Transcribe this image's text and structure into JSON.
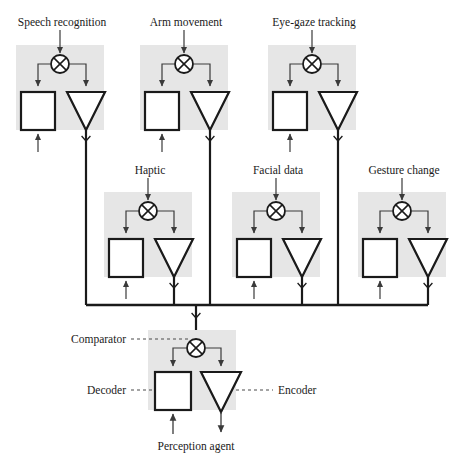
{
  "diagram": {
    "colors": {
      "panel_fill": "#e6e6e6",
      "stroke": "#1a1a1a",
      "thin_stroke": "#555555",
      "shape_fill": "#ffffff",
      "background": "#ffffff"
    },
    "top_row": [
      {
        "label": "Speech recognition",
        "panel": {
          "x": 16,
          "y": 45,
          "w": 88,
          "h": 85
        },
        "comparator": {
          "cx": 60,
          "cy": 64,
          "r": 9
        },
        "decoder": {
          "x": 21,
          "y": 92,
          "w": 34,
          "h": 38
        },
        "encoder": {
          "cx": 86,
          "top": 92,
          "halfw": 19,
          "h": 38
        },
        "input_arrow_x": 60,
        "decoder_input_x": 38,
        "output_x": 86
      },
      {
        "label": "Arm movement",
        "panel": {
          "x": 140,
          "y": 45,
          "w": 88,
          "h": 85
        },
        "comparator": {
          "cx": 184,
          "cy": 64,
          "r": 9
        },
        "decoder": {
          "x": 145,
          "y": 92,
          "w": 34,
          "h": 38
        },
        "encoder": {
          "cx": 210,
          "top": 92,
          "halfw": 19,
          "h": 38
        },
        "input_arrow_x": 184,
        "decoder_input_x": 162,
        "output_x": 210
      },
      {
        "label": "Eye-gaze tracking",
        "panel": {
          "x": 268,
          "y": 45,
          "w": 88,
          "h": 85
        },
        "comparator": {
          "cx": 312,
          "cy": 64,
          "r": 9
        },
        "decoder": {
          "x": 273,
          "y": 92,
          "w": 34,
          "h": 38
        },
        "encoder": {
          "cx": 338,
          "top": 92,
          "halfw": 19,
          "h": 38
        },
        "input_arrow_x": 312,
        "decoder_input_x": 290,
        "output_x": 338
      }
    ],
    "middle_row": [
      {
        "label": "Haptic",
        "panel": {
          "x": 104,
          "y": 192,
          "w": 88,
          "h": 85
        },
        "comparator": {
          "cx": 148,
          "cy": 211,
          "r": 9
        },
        "decoder": {
          "x": 109,
          "y": 239,
          "w": 34,
          "h": 38
        },
        "encoder": {
          "cx": 174,
          "top": 239,
          "halfw": 19,
          "h": 38
        },
        "input_arrow_x": 148,
        "decoder_input_x": 126,
        "output_x": 174
      },
      {
        "label": "Facial data",
        "panel": {
          "x": 232,
          "y": 192,
          "w": 88,
          "h": 85
        },
        "comparator": {
          "cx": 276,
          "cy": 211,
          "r": 9
        },
        "decoder": {
          "x": 237,
          "y": 239,
          "w": 34,
          "h": 38
        },
        "encoder": {
          "cx": 302,
          "top": 239,
          "halfw": 19,
          "h": 38
        },
        "input_arrow_x": 276,
        "decoder_input_x": 254,
        "output_x": 302
      },
      {
        "label": "Gesture change",
        "panel": {
          "x": 358,
          "y": 192,
          "w": 88,
          "h": 85
        },
        "comparator": {
          "cx": 402,
          "cy": 211,
          "r": 9
        },
        "decoder": {
          "x": 363,
          "y": 239,
          "w": 34,
          "h": 38
        },
        "encoder": {
          "cx": 428,
          "top": 239,
          "halfw": 19,
          "h": 38
        },
        "input_arrow_x": 402,
        "decoder_input_x": 380,
        "output_x": 428
      }
    ],
    "bottom_unit": {
      "label": "Perception agent",
      "panel": {
        "x": 148,
        "y": 330,
        "w": 88,
        "h": 80
      },
      "comparator": {
        "cx": 196,
        "cy": 348,
        "r": 9
      },
      "decoder": {
        "x": 155,
        "y": 372,
        "w": 36,
        "h": 38
      },
      "encoder": {
        "cx": 221,
        "top": 372,
        "halfw": 20,
        "h": 40
      },
      "callouts": {
        "comparator": "Comparator",
        "decoder": "Decoder",
        "encoder": "Encoder"
      }
    },
    "bus": {
      "y": 305,
      "x_start": 86,
      "x_end": 428,
      "merge_x": 196,
      "branch_xs": [
        86,
        174,
        210,
        302,
        338,
        428
      ]
    }
  }
}
